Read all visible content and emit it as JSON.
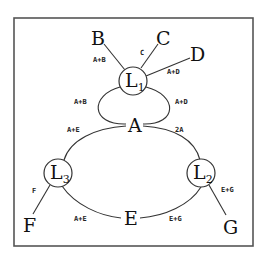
{
  "diagram": {
    "nodes": {
      "L1": {
        "label": "L",
        "sub": "1"
      },
      "L2": {
        "label": "L",
        "sub": "2"
      },
      "L3": {
        "label": "L",
        "sub": "3"
      },
      "A": {
        "label": "A"
      },
      "E": {
        "label": "E"
      }
    },
    "leaves": {
      "B": "B",
      "C": "C",
      "D": "D",
      "F": "F",
      "G": "G"
    },
    "edge_labels": {
      "L1_B": "A+B",
      "L1_C": "C",
      "L1_D": "A+D",
      "L1_A_left": "A+B",
      "L1_A_right": "A+D",
      "A_L3": "A+E",
      "A_L2": "2A",
      "L3_F": "F",
      "L3_E": "A+E",
      "E_L2": "E+G",
      "L2_G": "E+G"
    }
  }
}
